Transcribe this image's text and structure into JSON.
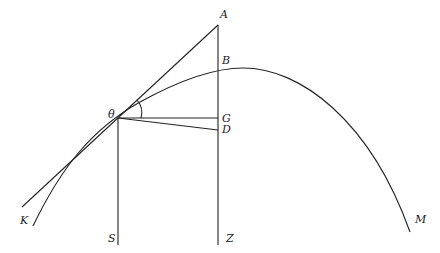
{
  "diagram": {
    "type": "geometric-construction",
    "labels": {
      "A": "A",
      "B": "B",
      "theta": "θ",
      "G": "G",
      "D": "D",
      "K": "K",
      "S": "S",
      "Z": "Z",
      "M": "M"
    },
    "points": {
      "A": [
        218,
        25
      ],
      "B": [
        218,
        70
      ],
      "theta": [
        118,
        118
      ],
      "G": [
        218,
        118
      ],
      "D": [
        218,
        130
      ],
      "S": [
        118,
        245
      ],
      "Z": [
        218,
        245
      ],
      "K_curve_end": [
        33,
        226
      ],
      "K_tangent_end": [
        22,
        207
      ],
      "M": [
        410,
        232
      ]
    },
    "colors": {
      "stroke": "#222222",
      "background": "#ffffff"
    }
  }
}
